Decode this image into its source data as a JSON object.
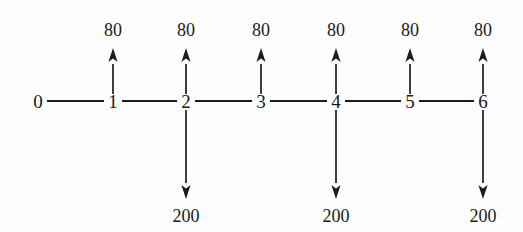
{
  "diagram": {
    "type": "beam-load-diagram",
    "background_color": "#fdfdfd",
    "ink_color": "#1c1c1c",
    "axis": {
      "y": 101,
      "start_x": 38,
      "end_x": 483,
      "node_spacing": 74.2
    },
    "nodes": [
      {
        "id": "n0",
        "label": "0",
        "x": 38,
        "y": 101
      },
      {
        "id": "n1",
        "label": "1",
        "x": 113,
        "y": 101
      },
      {
        "id": "n2",
        "label": "2",
        "x": 186,
        "y": 101
      },
      {
        "id": "n3",
        "label": "3",
        "x": 261,
        "y": 101
      },
      {
        "id": "n4",
        "label": "4",
        "x": 336,
        "y": 101
      },
      {
        "id": "n5",
        "label": "5",
        "x": 410,
        "y": 101
      },
      {
        "id": "n6",
        "label": "6",
        "x": 483,
        "y": 101
      }
    ],
    "up_loads": [
      {
        "node": "1",
        "x": 113,
        "value": "80",
        "label_y": 36,
        "tip_y": 48,
        "tail_y": 94
      },
      {
        "node": "2",
        "x": 186,
        "value": "80",
        "label_y": 36,
        "tip_y": 48,
        "tail_y": 94
      },
      {
        "node": "3",
        "x": 261,
        "value": "80",
        "label_y": 36,
        "tip_y": 48,
        "tail_y": 94
      },
      {
        "node": "4",
        "x": 336,
        "value": "80",
        "label_y": 36,
        "tip_y": 48,
        "tail_y": 94
      },
      {
        "node": "5",
        "x": 410,
        "value": "80",
        "label_y": 36,
        "tip_y": 48,
        "tail_y": 94
      },
      {
        "node": "6",
        "x": 483,
        "value": "80",
        "label_y": 36,
        "tip_y": 48,
        "tail_y": 94
      }
    ],
    "down_loads": [
      {
        "node": "2",
        "x": 186,
        "value": "200",
        "label_y": 222,
        "tip_y": 199,
        "tail_y": 110
      },
      {
        "node": "4",
        "x": 336,
        "value": "200",
        "label_y": 222,
        "tip_y": 199,
        "tail_y": 110
      },
      {
        "node": "6",
        "x": 483,
        "value": "200",
        "label_y": 222,
        "tip_y": 199,
        "tail_y": 110
      }
    ]
  },
  "chart_data": {
    "type": "diagram",
    "title": "",
    "xlabel": "",
    "ylabel": "",
    "categories": [
      "0",
      "1",
      "2",
      "3",
      "4",
      "5",
      "6"
    ],
    "series": [
      {
        "name": "upward load",
        "direction": "up",
        "unit_label": "80",
        "values": [
          null,
          80,
          80,
          80,
          80,
          80,
          80
        ]
      },
      {
        "name": "downward load",
        "direction": "down",
        "unit_label": "200",
        "values": [
          null,
          null,
          200,
          null,
          200,
          null,
          200
        ]
      }
    ]
  }
}
